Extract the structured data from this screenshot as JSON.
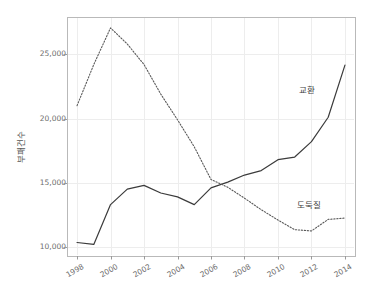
{
  "chart_data": {
    "type": "line",
    "title": "",
    "xlabel": "",
    "ylabel": "부패건수",
    "x": [
      1998,
      1999,
      2000,
      2001,
      2002,
      2003,
      2004,
      2005,
      2006,
      2007,
      2008,
      2009,
      2010,
      2011,
      2012,
      2013,
      2014
    ],
    "xlim": [
      1997.4,
      2014.6
    ],
    "ylim": [
      9300,
      27900
    ],
    "xticks": [
      1998,
      2000,
      2002,
      2004,
      2006,
      2008,
      2010,
      2012,
      2014
    ],
    "xtick_labels": [
      "1998",
      "2000",
      "2002",
      "2004",
      "2006",
      "2008",
      "2010",
      "2012",
      "2014"
    ],
    "yticks": [
      10000,
      15000,
      20000,
      25000
    ],
    "ytick_labels": [
      "10,000",
      "15,000",
      "20,000",
      "25,000"
    ],
    "grid": true,
    "legend_position": "inline-annotation",
    "series": [
      {
        "name": "교환",
        "style": "solid",
        "color": "#3b3b3b",
        "label_x": 2012.1,
        "label_y": 22400,
        "values": [
          10350,
          10200,
          13300,
          14500,
          14800,
          14200,
          13900,
          13300,
          14600,
          15050,
          15600,
          15950,
          16800,
          17000,
          18200,
          20100,
          24150
        ]
      },
      {
        "name": "도둑질",
        "style": "dotted",
        "color": "#5a5a5a",
        "label_x": 2012.0,
        "label_y": 13450,
        "values": [
          21000,
          24200,
          27050,
          25800,
          24200,
          21900,
          19900,
          17800,
          15250,
          14650,
          13800,
          12900,
          12100,
          11350,
          11250,
          12150,
          12250
        ]
      }
    ]
  },
  "plot_box": {
    "left": 67,
    "top": 17,
    "right": 355,
    "bottom": 256,
    "border_color": "#b9b9b9",
    "grid_color": "#ededed",
    "background": "#ffffff"
  },
  "axis": {
    "tick_color": "#9a9a9a",
    "label_color": "#6d6d6d"
  }
}
